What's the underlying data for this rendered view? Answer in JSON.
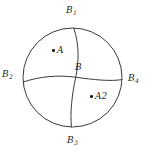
{
  "figure": {
    "type": "geometric-diagram",
    "background_color": "#ffffff",
    "stroke_color": "#3a3a3a",
    "text_color": "#262626",
    "canvas": {
      "width": 153,
      "height": 154
    },
    "circle": {
      "cx": 72.5,
      "cy": 77.5,
      "r": 49.5
    },
    "boundary_labels": [
      {
        "id": "B1",
        "base": "B",
        "sub": "1",
        "position": "top",
        "x": 66,
        "y": 6
      },
      {
        "id": "B2",
        "base": "B",
        "sub": "2",
        "position": "left",
        "x": 2,
        "y": 70
      },
      {
        "id": "B4",
        "base": "B",
        "sub": "4",
        "position": "right",
        "x": 128,
        "y": 74
      },
      {
        "id": "B3",
        "base": "B",
        "sub": "3",
        "position": "bottom",
        "x": 67,
        "y": 136
      }
    ],
    "center_label": {
      "id": "B",
      "base": "B",
      "sub": "",
      "x": 75,
      "y": 63
    },
    "interior_points": [
      {
        "id": "A",
        "base": "A",
        "sub": "",
        "dot_x": 52,
        "dot_y": 50,
        "label_x": 52,
        "label_y": 46
      },
      {
        "id": "A2",
        "base": "A",
        "sub": "2",
        "dot_x": 90,
        "dot_y": 96,
        "label_x": 90,
        "label_y": 92
      }
    ],
    "arcs": {
      "vertical": {
        "from": "B1",
        "to": "B3",
        "note": "near-vertical arc through center B"
      },
      "horizontal": {
        "from": "B2",
        "to": "B4",
        "note": "near-horizontal arc through center B"
      }
    }
  }
}
